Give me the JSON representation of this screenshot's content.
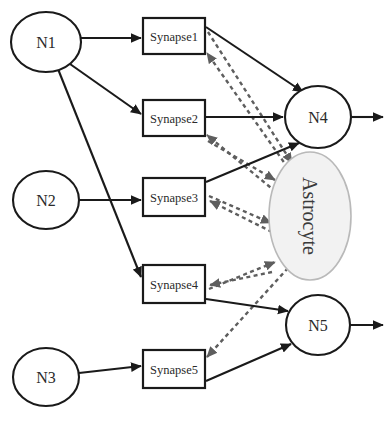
{
  "figure": {
    "type": "node-link-diagram"
  },
  "colors": {
    "stroke_solid": "#1a1a1a",
    "stroke_dashed": "#5e5e5e",
    "astrocyte_fill": "#f2f2f2",
    "astrocyte_stroke": "#b9b9b9",
    "node_fill": "#ffffff",
    "background": "#ffffff"
  },
  "nodes": {
    "presynaptic_neurons": [
      {
        "id": "N1",
        "label": "N1",
        "cx": 46,
        "cy": 42,
        "rx": 35,
        "ry": 30
      },
      {
        "id": "N2",
        "label": "N2",
        "cx": 46,
        "cy": 200,
        "rx": 33,
        "ry": 29
      },
      {
        "id": "N3",
        "label": "N3",
        "cx": 46,
        "cy": 377,
        "rx": 33,
        "ry": 29
      }
    ],
    "postsynaptic_neurons": [
      {
        "id": "N4",
        "label": "N4",
        "cx": 318,
        "cy": 117,
        "rx": 33,
        "ry": 31
      },
      {
        "id": "N5",
        "label": "N5",
        "cx": 318,
        "cy": 325,
        "rx": 32,
        "ry": 30
      }
    ],
    "synapses": [
      {
        "id": "S1",
        "label": "Synapse1",
        "x": 143,
        "y": 18,
        "w": 62,
        "h": 36
      },
      {
        "id": "S2",
        "label": "Synapse2",
        "x": 143,
        "y": 100,
        "w": 62,
        "h": 36
      },
      {
        "id": "S3",
        "label": "Synapse3",
        "x": 143,
        "y": 178,
        "w": 62,
        "h": 38
      },
      {
        "id": "S4",
        "label": "Synapse4",
        "x": 143,
        "y": 265,
        "w": 62,
        "h": 38
      },
      {
        "id": "S5",
        "label": "Synapse5",
        "x": 143,
        "y": 350,
        "w": 62,
        "h": 38
      }
    ],
    "glia": [
      {
        "id": "A1",
        "label": "Astrocyte",
        "cx": 310,
        "cy": 216,
        "rx": 41,
        "ry": 64,
        "text_rotation_deg": 90
      }
    ]
  },
  "edges": {
    "neuron_to_synapse": [
      {
        "from": "N1",
        "to": "S1",
        "style": "solid",
        "arrow": "end"
      },
      {
        "from": "N1",
        "to": "S2",
        "style": "solid",
        "arrow": "end"
      },
      {
        "from": "N1",
        "to": "S4",
        "style": "solid",
        "arrow": "end"
      },
      {
        "from": "N2",
        "to": "S3",
        "style": "solid",
        "arrow": "end"
      },
      {
        "from": "N3",
        "to": "S5",
        "style": "solid",
        "arrow": "end"
      }
    ],
    "synapse_to_neuron": [
      {
        "from": "S1",
        "to": "N4",
        "style": "solid",
        "arrow": "end"
      },
      {
        "from": "S2",
        "to": "N4",
        "style": "solid",
        "arrow": "end"
      },
      {
        "from": "S3",
        "to": "N4",
        "style": "solid",
        "arrow": "end"
      },
      {
        "from": "S4",
        "to": "N5",
        "style": "solid",
        "arrow": "end"
      },
      {
        "from": "S5",
        "to": "N5",
        "style": "solid",
        "arrow": "end"
      }
    ],
    "synapse_to_astrocyte": [
      {
        "from": "S1",
        "to": "A1",
        "style": "dashed",
        "arrow": "end"
      },
      {
        "from": "S2",
        "to": "A1",
        "style": "dashed",
        "arrow": "end"
      },
      {
        "from": "S3",
        "to": "A1",
        "style": "dashed",
        "arrow": "end"
      },
      {
        "from": "S4",
        "to": "A1",
        "style": "dashed",
        "arrow": "end"
      }
    ],
    "astrocyte_to_synapse": [
      {
        "from": "A1",
        "to": "S1",
        "style": "dashed",
        "arrow": "end"
      },
      {
        "from": "A1",
        "to": "S2",
        "style": "dashed",
        "arrow": "end"
      },
      {
        "from": "A1",
        "to": "S3",
        "style": "dashed",
        "arrow": "end"
      },
      {
        "from": "A1",
        "to": "S4",
        "style": "dashed",
        "arrow": "end"
      },
      {
        "from": "A1",
        "to": "S5",
        "style": "dashed",
        "arrow": "end"
      }
    ],
    "outputs": [
      {
        "from": "N4",
        "label": "",
        "style": "solid",
        "arrow": "end"
      },
      {
        "from": "N5",
        "label": "",
        "style": "solid",
        "arrow": "end"
      }
    ]
  }
}
